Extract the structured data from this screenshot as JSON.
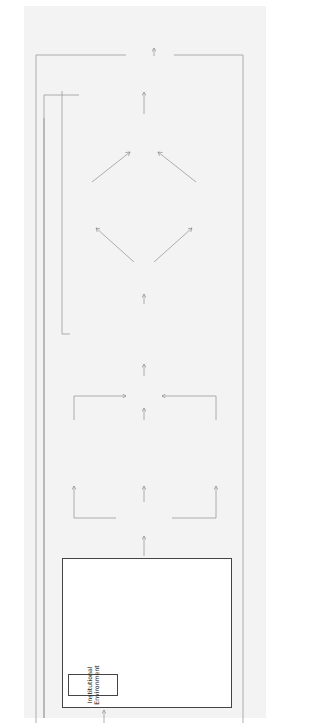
{
  "caption": {
    "label": "FIGURE 5.2",
    "text": "A framework for corporate reputation research."
  },
  "antecedents": {
    "blocks": [
      {
        "title": "Institutional\nEnvironment",
        "bullets": [
          "Networks",
          "Rules/Standards",
          "Isomorphism"
        ]
      },
      {
        "title": "Organizational\nSymbolism",
        "bullets": [
          "History",
          "Ideology",
          "Culture/Values"
        ]
      },
      {
        "title": "Strategic\nIssues",
        "bullets": [
          "Environmental",
          "Social/Political",
          "Economic"
        ]
      },
      {
        "title": "Organizational\nStrategy",
        "bullets": [
          "Diversification",
          "Differentiation"
        ]
      }
    ]
  },
  "corporate_identity": {
    "title": "Corporate\nIdentity"
  },
  "strategic_posture": {
    "title": "Strategic\nPosture",
    "bullets": [
      "Value/Pricing",
      "Quality/Service",
      "Innovation/Imitation",
      "Governance",
      "Leader/Follower"
    ]
  },
  "media_coverage": {
    "title": "Media\nCoverage",
    "bullets": [
      "Level of Attention",
      "Distinction/Difference"
    ]
  },
  "projected_image": {
    "title": "Projected\nImage"
  },
  "construed_image": {
    "title": "Construed\nImage"
  },
  "reputation_cluster": {
    "items": [
      {
        "title": "Corporate\nVisibility"
      },
      {
        "title": "Corporate\nCelebrity"
      },
      {
        "title": "Corporate\nReputation"
      },
      {
        "title": "Corporate\nStatus"
      },
      {
        "title": "Corporate\nLegitimacy"
      }
    ]
  },
  "stakeholder_support": {
    "title": "Stakeholder\nSupport",
    "bullets": [
      "Loyalty/Engagement",
      "Buy/Lend/Invest",
      "Advocacy"
    ]
  },
  "resource_acquisition": {
    "title": "Resource\nAcquisition",
    "bullets": [
      "Financial",
      "Human",
      "Intellectual"
    ]
  },
  "resource_depletion": {
    "title": "Resource\nDepletion",
    "bullets": [
      "Petitions/Boycotts",
      "Penalties/Fines",
      "Regulations"
    ]
  },
  "organizational_performance": {
    "title": "Organizational\nPerformance",
    "bullets": [
      "Efficiency",
      "Productivity",
      "Profitability"
    ]
  },
  "institutional_performance": {
    "title": "Institutional\nPerformance",
    "bullets": [
      "Advantage",
      "Value Creation"
    ]
  },
  "colors": {
    "line": "#9a9a9a",
    "border": "#444444",
    "dark_fill": "#111111",
    "panel": "#f3f3f3"
  }
}
